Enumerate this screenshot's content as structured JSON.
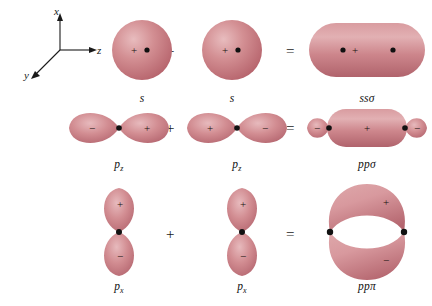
{
  "figure": {
    "background_color": "#ffffff",
    "orbital_color": "#c9737a",
    "orbital_color_light": "#e3aeb2",
    "orbital_color_dark": "#a8555e",
    "ink_color": "#111111"
  },
  "axes": {
    "x_label": "x",
    "y_label": "y",
    "z_label": "z"
  },
  "operators": {
    "plus": "+",
    "equals": "="
  },
  "signs": {
    "positive": "+",
    "negative": "−"
  },
  "rows": [
    {
      "id": "ss-sigma",
      "operand_a": {
        "label": "s",
        "label_plain": "s",
        "type": "s-orbital",
        "sign": "+"
      },
      "operand_b": {
        "label": "s",
        "label_plain": "s",
        "type": "s-orbital",
        "sign": "+"
      },
      "result": {
        "label": "ssσ",
        "label_plain": "sssigma",
        "type": "sigma-bonding-oval",
        "sign": "+",
        "nuclei": 2
      }
    },
    {
      "id": "pp-sigma",
      "operand_a": {
        "label": "p",
        "subscript": "z",
        "label_plain": "pz",
        "type": "p-orbital-horizontal",
        "left_lobe_sign": "−",
        "right_lobe_sign": "+"
      },
      "operand_b": {
        "label": "p",
        "subscript": "z",
        "label_plain": "pz",
        "type": "p-orbital-horizontal",
        "left_lobe_sign": "+",
        "right_lobe_sign": "−"
      },
      "result": {
        "label": "ppσ",
        "label_plain": "ppsigma",
        "type": "sigma-pp-overlap",
        "left_lobe_sign": "−",
        "center_sign": "+",
        "right_lobe_sign": "−",
        "nuclei": 2
      }
    },
    {
      "id": "pp-pi",
      "operand_a": {
        "label": "p",
        "subscript": "x",
        "label_plain": "px",
        "type": "p-orbital-vertical",
        "top_lobe_sign": "+",
        "bottom_lobe_sign": "−"
      },
      "operand_b": {
        "label": "p",
        "subscript": "x",
        "label_plain": "px",
        "type": "p-orbital-vertical",
        "top_lobe_sign": "+",
        "bottom_lobe_sign": "−"
      },
      "result": {
        "label": "ppπ",
        "label_plain": "pppi",
        "type": "pi-bonding-lobes",
        "top_lobe_sign": "+",
        "bottom_lobe_sign": "−",
        "nuclei": 2
      }
    }
  ]
}
